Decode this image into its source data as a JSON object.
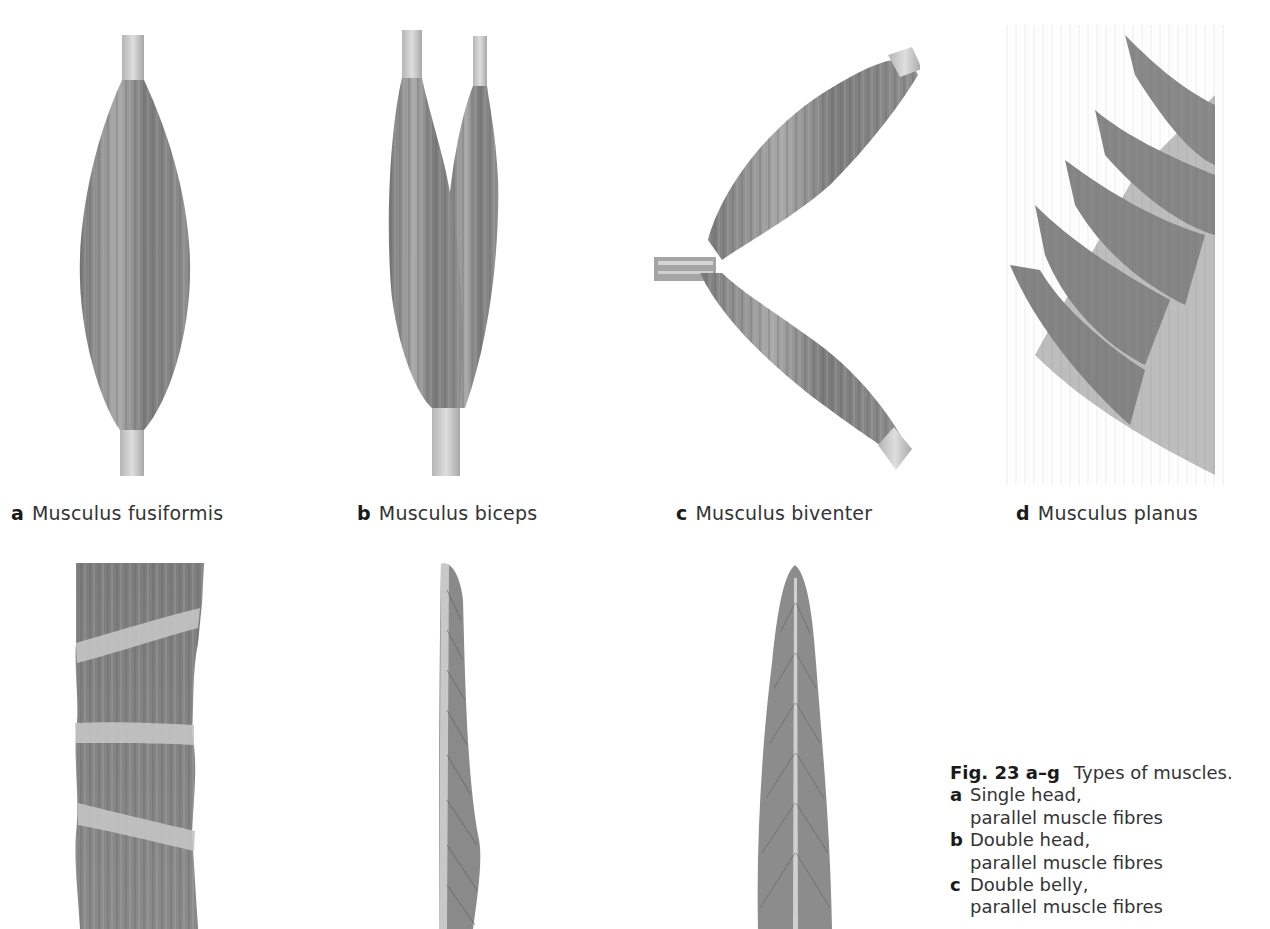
{
  "figures": [
    {
      "letter": "a",
      "name": "Musculus fusiformis"
    },
    {
      "letter": "b",
      "name": "Musculus biceps"
    },
    {
      "letter": "c",
      "name": "Musculus biventer"
    },
    {
      "letter": "d",
      "name": "Musculus planus"
    },
    {
      "letter": "e",
      "name": ""
    },
    {
      "letter": "f",
      "name": ""
    },
    {
      "letter": "g",
      "name": ""
    }
  ],
  "caption": {
    "fig_number": "Fig. 23 a–g",
    "title": "Types of muscles.",
    "items": [
      {
        "letter": "a",
        "line1": "Single head,",
        "line2": "parallel muscle fibres"
      },
      {
        "letter": "b",
        "line1": "Double head,",
        "line2": "parallel muscle fibres"
      },
      {
        "letter": "c",
        "line1": "Double belly,",
        "line2": "parallel muscle fibres"
      }
    ]
  },
  "colors": {
    "muscle_dark": "#6f6f6f",
    "muscle_mid": "#8c8c8c",
    "tendon": "#c8c8c8",
    "background": "#ffffff"
  }
}
